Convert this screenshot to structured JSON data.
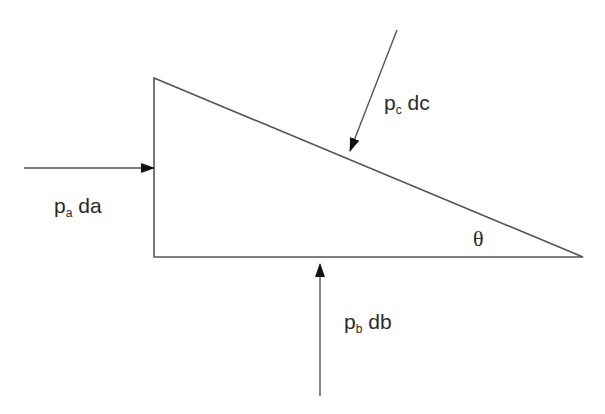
{
  "diagram": {
    "type": "free-body pressure wedge",
    "labels": {
      "force_a": {
        "main": "p",
        "sub": "a",
        "rest": " da"
      },
      "force_b": {
        "main": "p",
        "sub": "b",
        "rest": " db"
      },
      "force_c": {
        "main": "p",
        "sub": "c",
        "rest": " dc"
      },
      "angle": "θ"
    },
    "colors": {
      "line": "#555555",
      "arrowhead": "#111111",
      "text": "#2a2a2a",
      "background": "#ffffff"
    }
  }
}
